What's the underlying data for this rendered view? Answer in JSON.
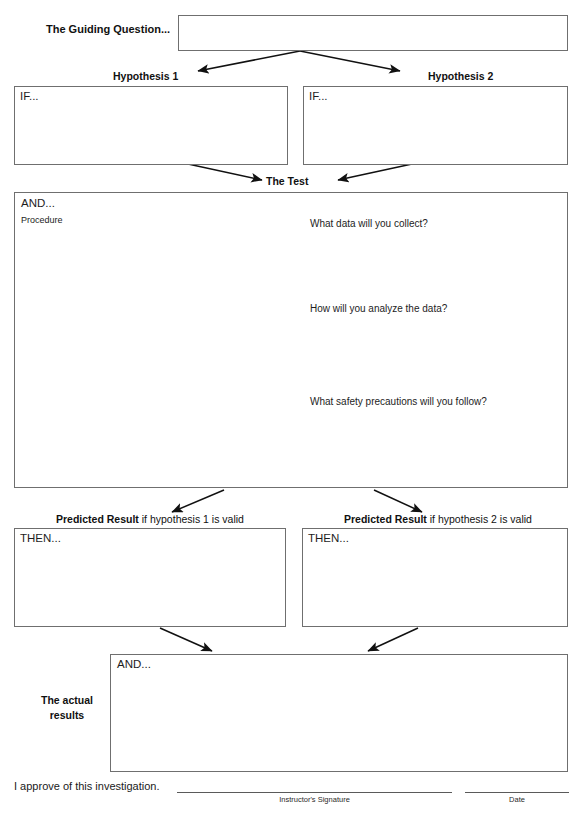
{
  "sheet": {
    "title": "Investigation Planning Worksheet"
  },
  "guiding": {
    "label": "The Guiding Question...",
    "box_placeholder": ""
  },
  "hypotheses": [
    {
      "heading": "Hypothesis 1",
      "field_tag": "IF..."
    },
    {
      "heading": "Hypothesis 2",
      "field_tag": "IF..."
    }
  ],
  "test": {
    "heading": "The Test",
    "field_tag": "AND...",
    "sub_tag": "Procedure",
    "prompts": [
      "What data will you collect?",
      "How will you analyze the data?",
      "What safety precautions will you follow?"
    ]
  },
  "predicted": [
    {
      "heading_bold": "Predicted Result",
      "heading_rest": " if hypothesis 1 is valid",
      "field_tag": "THEN..."
    },
    {
      "heading_bold": "Predicted Result",
      "heading_rest": " if hypothesis 2 is valid",
      "field_tag": "THEN..."
    }
  ],
  "actual": {
    "label_line1": "The actual",
    "label_line2": "results",
    "field_tag": "AND..."
  },
  "footer": {
    "approval_text": "I approve of this investigation.",
    "signature_caption": "Instructor's Signature",
    "date_caption": "Date"
  },
  "colors": {
    "ink": "#1a1a1a",
    "border": "#6f6f6f",
    "arrow": "#111111",
    "page": "#ffffff"
  }
}
